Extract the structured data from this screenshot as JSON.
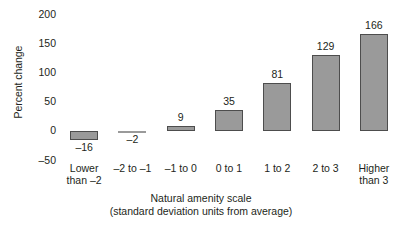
{
  "chart_data": {
    "type": "bar",
    "title": "",
    "xlabel": "Natural amenity scale",
    "xlabel_sub": "(standard deviation units from average)",
    "ylabel": "Percent change",
    "ylim": [
      -50,
      200
    ],
    "yticks": [
      200,
      150,
      100,
      50,
      0,
      -50
    ],
    "ytick_labels": [
      "200",
      "150",
      "100",
      "50",
      "0",
      "–50"
    ],
    "grid": false,
    "legend": "none",
    "categories": [
      "Lower than –2",
      "–2 to –1",
      "–1 to 0",
      "0 to 1",
      "1 to 2",
      "2 to 3",
      "Higher than 3"
    ],
    "category_lines": [
      [
        "Lower",
        "than –2"
      ],
      [
        "–2 to –1",
        ""
      ],
      [
        "–1 to 0",
        ""
      ],
      [
        "0 to 1",
        ""
      ],
      [
        "1 to 2",
        ""
      ],
      [
        "2 to 3",
        ""
      ],
      [
        "Higher",
        "than 3"
      ]
    ],
    "values": [
      -16,
      -2,
      9,
      35,
      81,
      129,
      166
    ],
    "value_labels": [
      "–16",
      "–2",
      "9",
      "35",
      "81",
      "129",
      "166"
    ],
    "bar_fill": "#9a9a9a",
    "bar_outline": "#4d4d4d",
    "background": "#ffffff",
    "text_color": "#231f20"
  }
}
